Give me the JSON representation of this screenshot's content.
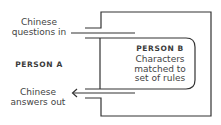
{
  "diagram": {
    "type": "chinese-room",
    "stroke_color": "#333333",
    "background": "#ffffff",
    "person_a": {
      "label": "PERSON A",
      "input_label": [
        "Chinese",
        "questions in"
      ],
      "output_label": [
        "Chinese",
        "answers out"
      ]
    },
    "person_b": {
      "label": "PERSON B",
      "description": [
        "Characters",
        "matched to",
        "set of rules"
      ]
    },
    "arrows": [
      {
        "name": "questions-in",
        "direction": "into-room"
      },
      {
        "name": "answers-out",
        "direction": "out-of-room",
        "arrowhead": "left"
      }
    ]
  }
}
